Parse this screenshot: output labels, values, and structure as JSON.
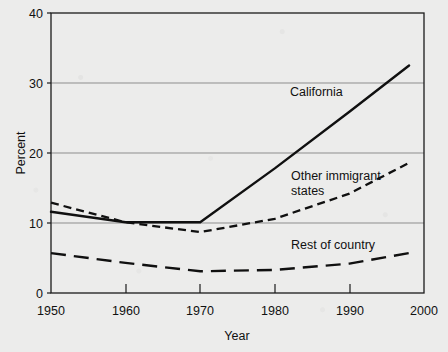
{
  "chart_data": {
    "type": "line",
    "title": "",
    "xlabel": "Year",
    "ylabel": "Percent",
    "xlim": [
      1950,
      2000
    ],
    "ylim": [
      0,
      40
    ],
    "xticks": [
      "1950",
      "1960",
      "1970",
      "1980",
      "1990",
      "2000"
    ],
    "yticks": [
      "0",
      "10",
      "20",
      "30",
      "40"
    ],
    "grid": "horizontal",
    "legend_position": "inline-annotations",
    "x": [
      1950,
      1960,
      1970,
      1980,
      1990,
      1998
    ],
    "series": [
      {
        "name": "California",
        "style": "solid",
        "color": "#101010",
        "values": [
          11.6,
          10.1,
          10.1,
          17.8,
          25.9,
          32.5
        ],
        "label_x": 1982,
        "label_y": 28.3
      },
      {
        "name": "Other immigrant states",
        "style": "short-dash",
        "color": "#101010",
        "values": [
          12.9,
          10.1,
          8.7,
          10.6,
          14.2,
          18.6
        ],
        "label_x": 1981,
        "label_y": 19.4
      },
      {
        "name": "Rest of country",
        "style": "long-dash",
        "color": "#101010",
        "values": [
          5.7,
          4.3,
          3.1,
          3.3,
          4.2,
          5.7
        ],
        "label_x": 1982,
        "label_y": 8.1
      }
    ]
  },
  "axes": {
    "y_label": "Percent",
    "x_label": "Year",
    "y_tick_labels": [
      "40",
      "30",
      "20",
      "10",
      "0"
    ],
    "x_tick_labels": [
      "1950",
      "1960",
      "1970",
      "1980",
      "1990",
      "2000"
    ]
  },
  "annotations": {
    "california": "California",
    "other_immigrant_line1": "Other immigrant",
    "other_immigrant_line2": "states",
    "rest_of_country": "Rest of country"
  },
  "colors": {
    "ink": "#101010",
    "grid": "#8d8d8d",
    "frame": "#1b1b1b",
    "paper": "#ececeb"
  }
}
